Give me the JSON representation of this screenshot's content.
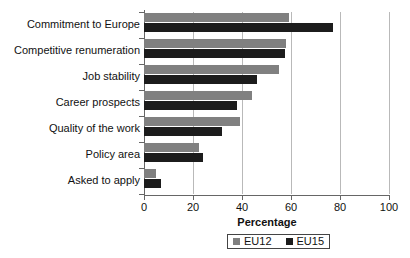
{
  "chart_data": {
    "type": "bar",
    "orientation": "horizontal",
    "title": "",
    "xlabel": "Percentage",
    "ylabel": "",
    "xlim": [
      0,
      100
    ],
    "xticks": [
      0,
      20,
      40,
      60,
      80,
      100
    ],
    "grid": true,
    "legend_position": "bottom",
    "categories": [
      "Commitment to Europe",
      "Competitive renumeration",
      "Job stability",
      "Career prospects",
      "Quality of the work",
      "Policy area",
      "Asked to apply"
    ],
    "series": [
      {
        "name": "EU12",
        "color": "#808080",
        "values": [
          59,
          58,
          55,
          44,
          39,
          22.5,
          5
        ]
      },
      {
        "name": "EU15",
        "color": "#1c1c1c",
        "values": [
          77,
          57.5,
          46,
          38,
          32,
          24,
          7
        ]
      }
    ]
  },
  "axis": {
    "x_title": "Percentage",
    "tick_labels": [
      "0",
      "20",
      "40",
      "60",
      "80",
      "100"
    ]
  },
  "legend": {
    "items": [
      {
        "label": "EU12",
        "swatch": "gray-swatch"
      },
      {
        "label": "EU15",
        "swatch": "dark-swatch"
      }
    ]
  }
}
